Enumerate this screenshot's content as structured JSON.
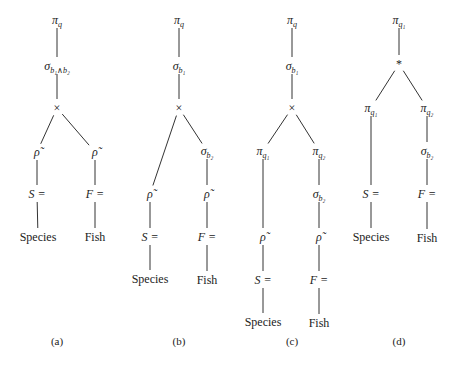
{
  "figure": {
    "trees": [
      {
        "id": "a",
        "caption": "(a)",
        "nodes": [
          {
            "id": "root",
            "sym": "π",
            "sub": "q",
            "x": 57,
            "y": 20
          },
          {
            "id": "sel",
            "sym": "σ",
            "sub": "b₁∧b₂",
            "x": 57,
            "y": 66
          },
          {
            "id": "x",
            "sym": "×",
            "sub": "",
            "x": 57,
            "y": 108
          },
          {
            "id": "rhoL",
            "sym": "ρ̃",
            "sub": "",
            "x": 37,
            "y": 152
          },
          {
            "id": "rhoR",
            "sym": "ρ̃",
            "sub": "",
            "x": 95,
            "y": 152
          },
          {
            "id": "sL",
            "sym": "S =",
            "sub": "",
            "x": 37,
            "y": 194,
            "italic": true
          },
          {
            "id": "fR",
            "sym": "F =",
            "sub": "",
            "x": 95,
            "y": 194,
            "italic": true
          },
          {
            "id": "species",
            "sym": "Species",
            "sub": "",
            "x": 38,
            "y": 237,
            "plain": true
          },
          {
            "id": "fish",
            "sym": "Fish",
            "sub": "",
            "x": 95,
            "y": 237,
            "plain": true
          }
        ],
        "edges": [
          [
            "root",
            "sel"
          ],
          [
            "sel",
            "x"
          ],
          [
            "x",
            "rhoL"
          ],
          [
            "x",
            "rhoR"
          ],
          [
            "rhoL",
            "sL"
          ],
          [
            "rhoR",
            "fR"
          ],
          [
            "sL",
            "species"
          ],
          [
            "fR",
            "fish"
          ]
        ]
      },
      {
        "id": "b",
        "caption": "(b)",
        "nodes": [
          {
            "id": "root",
            "sym": "π",
            "sub": "q",
            "x": 179,
            "y": 20
          },
          {
            "id": "sel",
            "sym": "σ",
            "sub": "b₁",
            "x": 179,
            "y": 66
          },
          {
            "id": "x",
            "sym": "×",
            "sub": "",
            "x": 179,
            "y": 108
          },
          {
            "id": "sel2",
            "sym": "σ",
            "sub": "b₂",
            "x": 207,
            "y": 151
          },
          {
            "id": "rhoL",
            "sym": "ρ̃",
            "sub": "",
            "x": 150,
            "y": 194
          },
          {
            "id": "rhoR",
            "sym": "ρ̃",
            "sub": "",
            "x": 207,
            "y": 194
          },
          {
            "id": "sL",
            "sym": "S =",
            "sub": "",
            "x": 150,
            "y": 237,
            "italic": true
          },
          {
            "id": "fR",
            "sym": "F =",
            "sub": "",
            "x": 207,
            "y": 237,
            "italic": true
          },
          {
            "id": "species",
            "sym": "Species",
            "sub": "",
            "x": 150,
            "y": 279,
            "plain": true
          },
          {
            "id": "fish",
            "sym": "Fish",
            "sub": "",
            "x": 207,
            "y": 280,
            "plain": true
          }
        ],
        "edges": [
          [
            "root",
            "sel"
          ],
          [
            "sel",
            "x"
          ],
          [
            "x",
            "rhoL"
          ],
          [
            "x",
            "sel2"
          ],
          [
            "sel2",
            "rhoR"
          ],
          [
            "rhoL",
            "sL"
          ],
          [
            "rhoR",
            "fR"
          ],
          [
            "sL",
            "species"
          ],
          [
            "fR",
            "fish"
          ]
        ]
      },
      {
        "id": "c",
        "caption": "(c)",
        "nodes": [
          {
            "id": "root",
            "sym": "π",
            "sub": "q",
            "x": 292,
            "y": 20
          },
          {
            "id": "sel",
            "sym": "σ",
            "sub": "b₁",
            "x": 292,
            "y": 66
          },
          {
            "id": "x",
            "sym": "×",
            "sub": "",
            "x": 292,
            "y": 108
          },
          {
            "id": "piL",
            "sym": "π",
            "sub": "q₁",
            "x": 263,
            "y": 151
          },
          {
            "id": "piR",
            "sym": "π",
            "sub": "q₂",
            "x": 319,
            "y": 151
          },
          {
            "id": "sel2",
            "sym": "σ",
            "sub": "b₂",
            "x": 319,
            "y": 194
          },
          {
            "id": "rhoL",
            "sym": "ρ̃",
            "sub": "",
            "x": 263,
            "y": 237
          },
          {
            "id": "rhoR",
            "sym": "ρ̃",
            "sub": "",
            "x": 319,
            "y": 237
          },
          {
            "id": "sL",
            "sym": "S =",
            "sub": "",
            "x": 263,
            "y": 280,
            "italic": true
          },
          {
            "id": "fR",
            "sym": "F =",
            "sub": "",
            "x": 319,
            "y": 280,
            "italic": true
          },
          {
            "id": "species",
            "sym": "Species",
            "sub": "",
            "x": 263,
            "y": 322,
            "plain": true
          },
          {
            "id": "fish",
            "sym": "Fish",
            "sub": "",
            "x": 319,
            "y": 323,
            "plain": true
          }
        ],
        "edges": [
          [
            "root",
            "sel"
          ],
          [
            "sel",
            "x"
          ],
          [
            "x",
            "piL"
          ],
          [
            "x",
            "piR"
          ],
          [
            "piR",
            "sel2"
          ],
          [
            "piL",
            "rhoL"
          ],
          [
            "sel2",
            "rhoR"
          ],
          [
            "rhoL",
            "sL"
          ],
          [
            "rhoR",
            "fR"
          ],
          [
            "sL",
            "species"
          ],
          [
            "fR",
            "fish"
          ]
        ]
      },
      {
        "id": "d",
        "caption": "(d)",
        "nodes": [
          {
            "id": "root",
            "sym": "π",
            "sub": "q₁",
            "x": 399,
            "y": 20
          },
          {
            "id": "join",
            "sym": "*",
            "sub": "",
            "x": 399,
            "y": 64
          },
          {
            "id": "piL",
            "sym": "π",
            "sub": "q₁",
            "x": 371,
            "y": 108
          },
          {
            "id": "piR",
            "sym": "π",
            "sub": "q₂",
            "x": 427,
            "y": 108
          },
          {
            "id": "sel2",
            "sym": "σ",
            "sub": "b₂",
            "x": 427,
            "y": 151
          },
          {
            "id": "sL",
            "sym": "S =",
            "sub": "",
            "x": 371,
            "y": 194,
            "italic": true
          },
          {
            "id": "fR",
            "sym": "F =",
            "sub": "",
            "x": 427,
            "y": 194,
            "italic": true
          },
          {
            "id": "species",
            "sym": "Species",
            "sub": "",
            "x": 371,
            "y": 237,
            "plain": true
          },
          {
            "id": "fish",
            "sym": "Fish",
            "sub": "",
            "x": 427,
            "y": 238,
            "plain": true
          }
        ],
        "edges": [
          [
            "root",
            "join"
          ],
          [
            "join",
            "piL"
          ],
          [
            "join",
            "piR"
          ],
          [
            "piR",
            "sel2"
          ],
          [
            "piL",
            "sL"
          ],
          [
            "sel2",
            "fR"
          ],
          [
            "sL",
            "species"
          ],
          [
            "fR",
            "fish"
          ]
        ]
      }
    ],
    "captions": [
      "(a)",
      "(b)",
      "(c)",
      "(d)"
    ]
  }
}
